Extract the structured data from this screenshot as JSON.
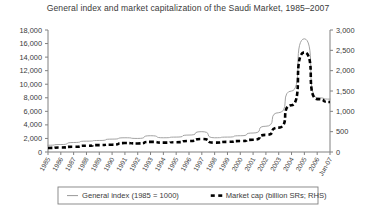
{
  "chart_data": {
    "type": "line",
    "title": "General index and market capitalization of the Saudi Market, 1985–2007",
    "xlabel": "",
    "ylabel": "",
    "grid": false,
    "legend_position": "bottom",
    "categories": [
      "1985",
      "1986",
      "1987",
      "1988",
      "1989",
      "1990",
      "1991",
      "1992",
      "1993",
      "1994",
      "1995",
      "1996",
      "1997",
      "1998",
      "1999",
      "2000",
      "2001",
      "2002",
      "2003",
      "2004",
      "2005",
      "2006",
      "Jun-07"
    ],
    "left_axis": {
      "label": "",
      "ylim": [
        0,
        18000
      ],
      "tick_step": 2000,
      "ticks": [
        "0",
        "2,000",
        "4,000",
        "6,000",
        "8,000",
        "10,000",
        "12,000",
        "14,000",
        "16,000",
        "18,000"
      ]
    },
    "right_axis": {
      "label": "RHS",
      "ylim": [
        0,
        3000
      ],
      "tick_step": 500,
      "ticks": [
        "0",
        "500",
        "1,000",
        "1,500",
        "2,000",
        "2,500",
        "3,000"
      ]
    },
    "series": [
      {
        "name": "General index (1985 = 1000)",
        "axis": "left",
        "style": "solid-thin",
        "color": "#999999",
        "values": [
          1000,
          1100,
          1400,
          1600,
          1700,
          1900,
          2100,
          2000,
          2400,
          2100,
          2200,
          2500,
          3000,
          2100,
          2200,
          2400,
          2800,
          3800,
          5800,
          9000,
          16700,
          8000,
          7800
        ]
      },
      {
        "name": "Market cap (billion SRs; RHS)",
        "axis": "right",
        "style": "dashed-thick",
        "color": "#000000",
        "values": [
          100,
          110,
          130,
          155,
          170,
          180,
          220,
          210,
          250,
          230,
          240,
          270,
          320,
          230,
          250,
          270,
          300,
          420,
          600,
          1150,
          2450,
          1300,
          1230
        ]
      }
    ],
    "legend": [
      {
        "label": "General index (1985 = 1000)",
        "marker": "line-thin-gray",
        "color": "#999999"
      },
      {
        "label": "Market cap (billion SRs; RHS)",
        "marker": "dash-thick-black",
        "color": "#000000"
      }
    ]
  }
}
